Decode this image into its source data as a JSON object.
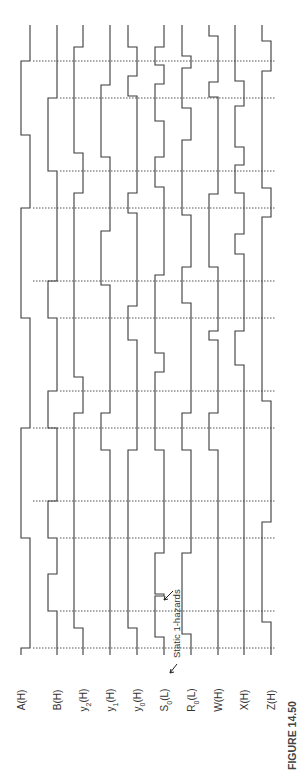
{
  "figure": {
    "caption": "FIGURE 14.50",
    "orientation": "rotated-90-ccw",
    "annotation": "Static 1-hazards"
  },
  "geometry": {
    "trace_top": 25,
    "trace_bottom": 655,
    "swing": 9,
    "time_lines": [
      61,
      98,
      171,
      208,
      281,
      318,
      391,
      428,
      501,
      538,
      611,
      648
    ],
    "time_line_x_start": [
      33,
      60,
      60,
      33,
      33,
      60,
      60,
      33,
      33,
      60,
      60,
      33
    ],
    "time_line_x_end": 276
  },
  "signals": [
    {
      "id": "A",
      "label": "A(H)",
      "low_x": 21,
      "start_level": 0,
      "transitions": [
        648,
        538,
        428,
        318,
        208,
        135,
        61
      ]
    },
    {
      "id": "B",
      "label": "B(H)",
      "low_x": 48,
      "start_level": 1,
      "transitions": [
        611,
        574,
        538,
        501,
        428,
        391,
        318,
        281,
        171,
        98
      ]
    },
    {
      "id": "y2",
      "label": "y₂(H)",
      "label_main": "y",
      "label_sub": "2",
      "label_tail": "(H)",
      "low_x": 74,
      "start_level": 1,
      "transitions": [
        628,
        413,
        377,
        193,
        153,
        47
      ]
    },
    {
      "id": "y1",
      "label": "y₁(H)",
      "label_main": "y",
      "label_sub": "1",
      "label_tail": "(H)",
      "low_x": 101,
      "start_level": 1,
      "transitions": [
        450,
        413,
        285,
        231,
        157,
        85
      ]
    },
    {
      "id": "y0",
      "label": "y₀(H)",
      "label_main": "y",
      "label_sub": "0",
      "label_tail": "(H)",
      "low_x": 128,
      "start_level": 1,
      "transitions": [
        628,
        450,
        340,
        306,
        213,
        193,
        96,
        76,
        47
      ]
    },
    {
      "id": "S0",
      "label": "S₀(L)",
      "label_main": "S",
      "label_sub": "0",
      "label_tail": "(L)",
      "low_x": 155,
      "start_level": 1,
      "transitions": [
        637,
        596,
        594,
        553,
        450,
        372,
        353,
        275,
        187,
        157,
        121,
        84,
        65,
        47
      ]
    },
    {
      "id": "R0",
      "label": "R₀(L)",
      "label_main": "R",
      "label_sub": "0",
      "label_tail": "(L)",
      "low_x": 182,
      "start_level": 1,
      "transitions": [
        671,
        669,
        634,
        553,
        450,
        413,
        303,
        267,
        215,
        140,
        108,
        68,
        56
      ]
    },
    {
      "id": "W",
      "label": "W(H)",
      "label_main": "W",
      "label_sub": "",
      "label_tail": "(H)",
      "low_x": 209,
      "start_level": 1,
      "transitions": [
        450,
        413,
        340,
        331,
        267,
        194,
        97,
        82,
        36
      ]
    },
    {
      "id": "X",
      "label": "X(H)",
      "label_main": "X",
      "label_sub": "",
      "label_tail": "(H)",
      "low_x": 235,
      "start_level": 1,
      "transitions": [
        365,
        331,
        254,
        234,
        193,
        165,
        147,
        106,
        81
      ]
    },
    {
      "id": "Z",
      "label": "Z(H)",
      "label_main": "Z",
      "label_sub": "",
      "label_tail": "(H)",
      "low_x": 262,
      "start_level": 1,
      "transitions": [
        622,
        522,
        401,
        217,
        188,
        71,
        41
      ]
    }
  ],
  "hazards": [
    {
      "signal": "S0",
      "y": 596,
      "label": "Static 1-hazards"
    },
    {
      "signal": "R0",
      "y": 670,
      "label": "Static 1-hazards"
    }
  ]
}
